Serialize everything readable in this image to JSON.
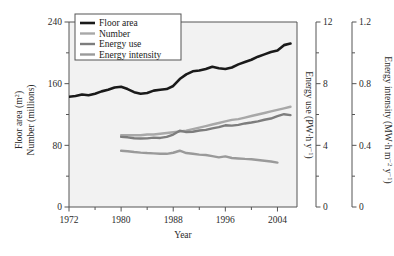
{
  "figure": {
    "background_color": "#ffffff",
    "plot_background_color": "#f2f2f2",
    "frame_color": "#555555"
  },
  "chart_data": {
    "type": "line",
    "title": "",
    "xlabel": "Year",
    "grid": false,
    "legend_position": "top-left",
    "xlim": [
      1972,
      2007
    ],
    "xticks": [
      1972,
      1980,
      1988,
      1996,
      2004
    ],
    "xminor_ticks": [
      1976,
      1984,
      1992,
      2000
    ],
    "axes": [
      {
        "id": "left",
        "label_line1": "Floor area (m",
        "label_line1_sup": "2",
        "label_line1_end": ")",
        "label_line2": "Number (millions)",
        "ticks": [
          0,
          80,
          160,
          240
        ],
        "tick_labels": [
          "0",
          "80",
          "160",
          "240"
        ],
        "lim": [
          0,
          240
        ]
      },
      {
        "id": "right1",
        "label_a": "Energy use (PW",
        "label_mid": "·h y",
        "label_sup": "−1",
        "label_end": ")",
        "ticks": [
          0,
          4,
          8,
          12
        ],
        "tick_labels": [
          "0",
          "4",
          "8",
          "12"
        ],
        "lim": [
          0,
          12
        ]
      },
      {
        "id": "right2",
        "label_a": "Energy intensity (MW",
        "label_mid": "·h m",
        "label_sup1": "−2",
        "label_mid2": " y",
        "label_sup2": "−1",
        "label_end": ")",
        "ticks": [
          0,
          0.4,
          0.8,
          1.2
        ],
        "tick_labels": [
          "0",
          "0.4",
          "0.8",
          "1.2"
        ],
        "lim": [
          0,
          1.2
        ]
      }
    ],
    "series": [
      {
        "name": "Floor area",
        "legend_label": "Floor area",
        "color": "#1a1a1a",
        "width": 2.6,
        "axis": "left",
        "units": "m² (millions)",
        "x": [
          1972,
          1973,
          1974,
          1975,
          1976,
          1977,
          1978,
          1979,
          1980,
          1981,
          1982,
          1983,
          1984,
          1985,
          1986,
          1987,
          1988,
          1989,
          1990,
          1991,
          1992,
          1993,
          1994,
          1995,
          1996,
          1997,
          1998,
          1999,
          2000,
          2001,
          2002,
          2003,
          2004,
          2005,
          2006
        ],
        "y": [
          143,
          144,
          146,
          145,
          147,
          150,
          152,
          155,
          156,
          153,
          149,
          147,
          148,
          151,
          152,
          153,
          157,
          166,
          172,
          176,
          177,
          179,
          182,
          180,
          179,
          181,
          185,
          188,
          191,
          195,
          198,
          201,
          203,
          210,
          212
        ]
      },
      {
        "name": "Number",
        "legend_label": "Number",
        "color": "#a8a8a8",
        "width": 2.4,
        "axis": "left",
        "units": "millions",
        "x": [
          1980,
          1981,
          1982,
          1983,
          1984,
          1985,
          1986,
          1987,
          1988,
          1989,
          1990,
          1991,
          1992,
          1993,
          1994,
          1995,
          1996,
          1997,
          1998,
          1999,
          2000,
          2001,
          2002,
          2003,
          2004,
          2005,
          2006
        ],
        "y": [
          93,
          93,
          93,
          93,
          94,
          94,
          95,
          96,
          97,
          98,
          99,
          101,
          103,
          105,
          107,
          109,
          111,
          113,
          114,
          116,
          118,
          120,
          122,
          124,
          126,
          128,
          130
        ]
      },
      {
        "name": "Energy use",
        "legend_label": "Energy use",
        "color": "#7d7d7d",
        "width": 2.4,
        "axis": "right1",
        "units": "PW·h y⁻¹",
        "x": [
          1980,
          1981,
          1982,
          1983,
          1984,
          1985,
          1986,
          1987,
          1988,
          1989,
          1990,
          1991,
          1992,
          1993,
          1994,
          1995,
          1996,
          1997,
          1998,
          1999,
          2000,
          2001,
          2002,
          2003,
          2004,
          2005,
          2006
        ],
        "y": [
          4.55,
          4.52,
          4.46,
          4.44,
          4.45,
          4.5,
          4.48,
          4.55,
          4.7,
          4.95,
          4.86,
          4.88,
          4.96,
          5.0,
          5.1,
          5.18,
          5.3,
          5.28,
          5.33,
          5.42,
          5.48,
          5.55,
          5.66,
          5.74,
          5.9,
          6.02,
          5.96
        ]
      },
      {
        "name": "Energy intensity",
        "legend_label": "Energy intensity",
        "color": "#9a9a9a",
        "width": 2.4,
        "axis": "right2",
        "units": "MW·h m⁻² y⁻¹",
        "x": [
          1980,
          1981,
          1982,
          1983,
          1984,
          1985,
          1986,
          1987,
          1988,
          1989,
          1990,
          1991,
          1992,
          1993,
          1994,
          1995,
          1996,
          1997,
          1998,
          1999,
          2000,
          2001,
          2002,
          2003,
          2004
        ],
        "y": [
          0.365,
          0.362,
          0.357,
          0.353,
          0.35,
          0.348,
          0.345,
          0.345,
          0.352,
          0.365,
          0.35,
          0.345,
          0.34,
          0.337,
          0.33,
          0.322,
          0.328,
          0.318,
          0.315,
          0.312,
          0.31,
          0.305,
          0.3,
          0.295,
          0.288
        ]
      }
    ]
  }
}
